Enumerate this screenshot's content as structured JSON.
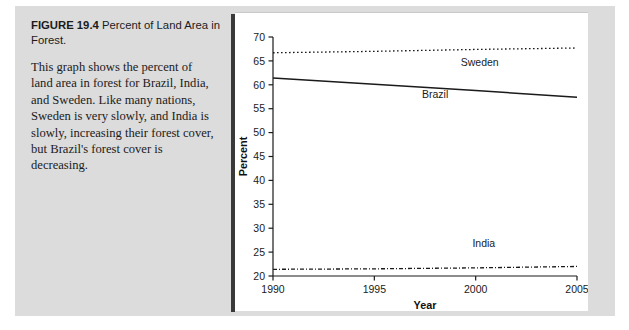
{
  "figure": {
    "label": "FIGURE 19.4",
    "title": "Percent of Land Area in Forest.",
    "caption": "This graph shows the percent of land area in forest for Brazil, India, and Sweden. Like many nations, Sweden is very slowly, and India is slowly, increasing their forest cover, but Brazil's forest cover is decreasing."
  },
  "chart_data": {
    "type": "line",
    "title": "",
    "xlabel": "Year",
    "ylabel": "Percent",
    "xlim": [
      1990,
      2005
    ],
    "ylim": [
      20,
      70
    ],
    "xticks": [
      1990,
      1995,
      2000,
      2005
    ],
    "yticks": [
      20,
      25,
      30,
      35,
      40,
      45,
      50,
      55,
      60,
      65,
      70
    ],
    "xticklabels": [
      "1990",
      "1995",
      "2000",
      "2005"
    ],
    "yticklabels": [
      "20",
      "25",
      "30",
      "35",
      "40",
      "45",
      "50",
      "55",
      "60",
      "65",
      "70"
    ],
    "grid": false,
    "legend": "inline-labels",
    "x": [
      1990,
      1995,
      2000,
      2005
    ],
    "series": [
      {
        "name": "Sweden",
        "style": "dotted",
        "color": "#1a1a1a",
        "values": [
          66.7,
          67.0,
          67.4,
          67.7
        ],
        "label_x": 2000.2,
        "label_y": 64.0
      },
      {
        "name": "Brazil",
        "style": "solid",
        "color": "#1a1a1a",
        "values": [
          61.4,
          60.1,
          58.8,
          57.4
        ],
        "label_x": 1998.0,
        "label_y": 57.3
      },
      {
        "name": "India",
        "style": "dash-dot",
        "color": "#1a1a1a",
        "values": [
          21.4,
          21.5,
          21.7,
          22.0
        ],
        "label_x": 2000.4,
        "label_y": 26.0
      }
    ]
  },
  "colors": {
    "mount_gray": "#dcdcdc",
    "panel_white": "#ffffff",
    "divider_dark": "#3a3a3a",
    "ink": "#1a1a1a"
  }
}
